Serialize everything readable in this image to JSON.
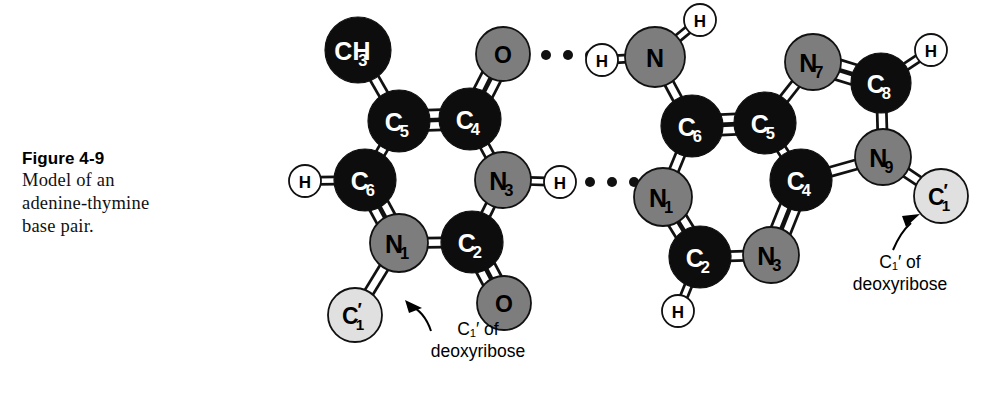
{
  "figure": {
    "number": "Figure 4-9",
    "caption_line1": "Model of an",
    "caption_line2": "adenine-thymine",
    "caption_line3": "base pair."
  },
  "colors": {
    "carbon": "#0d0d0d",
    "nitrogen": "#7d7d7d",
    "oxygen": "#7d7d7d",
    "hydrogen": "#ffffff",
    "sugar_carbon": "#e0e0e0",
    "outline": "#111111",
    "bond_fill": "#ffffff",
    "background": "#ffffff"
  },
  "annotations": {
    "left": {
      "line1": "C₁′ of",
      "line2": "deoxyribose"
    },
    "right": {
      "line1": "C₁′ of",
      "line2": "deoxyribose"
    }
  },
  "thymine": {
    "name": "thymine",
    "atoms": [
      {
        "id": "t-ch3",
        "label": "CH",
        "sub": "3",
        "type": "carbon",
        "x": 358,
        "y": 50,
        "r": 33
      },
      {
        "id": "t-c5",
        "label": "C",
        "sub": "5",
        "type": "carbon",
        "x": 399,
        "y": 121,
        "r": 31
      },
      {
        "id": "t-c4",
        "label": "C",
        "sub": "4",
        "type": "carbon",
        "x": 470,
        "y": 119,
        "r": 31
      },
      {
        "id": "t-o4",
        "label": "O",
        "sub": "",
        "type": "oxygen",
        "x": 503,
        "y": 54,
        "r": 27
      },
      {
        "id": "t-c6",
        "label": "C",
        "sub": "6",
        "type": "carbon",
        "x": 365,
        "y": 180,
        "r": 31
      },
      {
        "id": "t-h6",
        "label": "H",
        "sub": "",
        "type": "hydrogen",
        "x": 305,
        "y": 181,
        "r": 16
      },
      {
        "id": "t-n3",
        "label": "N",
        "sub": "3",
        "type": "nitrogen",
        "x": 503,
        "y": 180,
        "r": 28
      },
      {
        "id": "t-h3",
        "label": "H",
        "sub": "",
        "type": "hydrogen",
        "x": 560,
        "y": 182,
        "r": 16
      },
      {
        "id": "t-n1",
        "label": "N",
        "sub": "1",
        "type": "nitrogen",
        "x": 399,
        "y": 243,
        "r": 29
      },
      {
        "id": "t-c2",
        "label": "C",
        "sub": "2",
        "type": "carbon",
        "x": 472,
        "y": 242,
        "r": 31
      },
      {
        "id": "t-o2",
        "label": "O",
        "sub": "",
        "type": "oxygen",
        "x": 504,
        "y": 303,
        "r": 27
      },
      {
        "id": "t-c1p",
        "label": "C",
        "sub": "1",
        "prime": true,
        "type": "sugar_carbon",
        "x": 355,
        "y": 315,
        "r": 27
      }
    ],
    "bonds": [
      {
        "from": "t-ch3",
        "to": "t-c5",
        "order": 1
      },
      {
        "from": "t-c5",
        "to": "t-c4",
        "order": 2
      },
      {
        "from": "t-c4",
        "to": "t-o4",
        "order": 2
      },
      {
        "from": "t-c5",
        "to": "t-c6",
        "order": 1
      },
      {
        "from": "t-c6",
        "to": "t-h6",
        "order": 1
      },
      {
        "from": "t-c4",
        "to": "t-n3",
        "order": 1
      },
      {
        "from": "t-n3",
        "to": "t-h3",
        "order": 1
      },
      {
        "from": "t-c6",
        "to": "t-n1",
        "order": 2
      },
      {
        "from": "t-n3",
        "to": "t-c2",
        "order": 1
      },
      {
        "from": "t-n1",
        "to": "t-c2",
        "order": 1
      },
      {
        "from": "t-c2",
        "to": "t-o2",
        "order": 2
      },
      {
        "from": "t-n1",
        "to": "t-c1p",
        "order": 1
      }
    ]
  },
  "adenine": {
    "name": "adenine",
    "atoms": [
      {
        "id": "a-n6",
        "label": "N",
        "sub": "",
        "type": "nitrogen",
        "x": 655,
        "y": 57,
        "r": 30
      },
      {
        "id": "a-h6a",
        "label": "H",
        "sub": "",
        "type": "hydrogen",
        "x": 700,
        "y": 20,
        "r": 16
      },
      {
        "id": "a-h6b",
        "label": "H",
        "sub": "",
        "type": "hydrogen",
        "x": 602,
        "y": 60,
        "r": 16
      },
      {
        "id": "a-c6",
        "label": "C",
        "sub": "6",
        "type": "carbon",
        "x": 692,
        "y": 126,
        "r": 31
      },
      {
        "id": "a-c5",
        "label": "C",
        "sub": "5",
        "type": "carbon",
        "x": 765,
        "y": 123,
        "r": 31
      },
      {
        "id": "a-n7",
        "label": "N",
        "sub": "7",
        "type": "nitrogen",
        "x": 813,
        "y": 62,
        "r": 28
      },
      {
        "id": "a-c8",
        "label": "C",
        "sub": "8",
        "type": "carbon",
        "x": 881,
        "y": 83,
        "r": 30
      },
      {
        "id": "a-h8",
        "label": "H",
        "sub": "",
        "type": "hydrogen",
        "x": 931,
        "y": 50,
        "r": 16
      },
      {
        "id": "a-n9",
        "label": "N",
        "sub": "9",
        "type": "nitrogen",
        "x": 883,
        "y": 157,
        "r": 28
      },
      {
        "id": "a-c4",
        "label": "C",
        "sub": "4",
        "type": "carbon",
        "x": 801,
        "y": 180,
        "r": 31
      },
      {
        "id": "a-n1",
        "label": "N",
        "sub": "1",
        "type": "nitrogen",
        "x": 663,
        "y": 197,
        "r": 29
      },
      {
        "id": "a-c2",
        "label": "C",
        "sub": "2",
        "type": "carbon",
        "x": 700,
        "y": 257,
        "r": 31
      },
      {
        "id": "a-h2",
        "label": "H",
        "sub": "",
        "type": "hydrogen",
        "x": 678,
        "y": 311,
        "r": 16
      },
      {
        "id": "a-n3",
        "label": "N",
        "sub": "3",
        "type": "nitrogen",
        "x": 771,
        "y": 255,
        "r": 28
      },
      {
        "id": "a-c1p",
        "label": "C",
        "sub": "1",
        "prime": true,
        "type": "sugar_carbon",
        "x": 941,
        "y": 196,
        "r": 27
      }
    ],
    "bonds": [
      {
        "from": "a-n6",
        "to": "a-h6a",
        "order": 1
      },
      {
        "from": "a-n6",
        "to": "a-h6b",
        "order": 1
      },
      {
        "from": "a-n6",
        "to": "a-c6",
        "order": 1
      },
      {
        "from": "a-c6",
        "to": "a-c5",
        "order": 2
      },
      {
        "from": "a-c5",
        "to": "a-n7",
        "order": 1
      },
      {
        "from": "a-n7",
        "to": "a-c8",
        "order": 2
      },
      {
        "from": "a-c8",
        "to": "a-h8",
        "order": 1
      },
      {
        "from": "a-c8",
        "to": "a-n9",
        "order": 1
      },
      {
        "from": "a-n9",
        "to": "a-c4",
        "order": 1
      },
      {
        "from": "a-c5",
        "to": "a-c4",
        "order": 1
      },
      {
        "from": "a-c6",
        "to": "a-n1",
        "order": 1
      },
      {
        "from": "a-n1",
        "to": "a-c2",
        "order": 2
      },
      {
        "from": "a-c2",
        "to": "a-h2",
        "order": 1
      },
      {
        "from": "a-c2",
        "to": "a-n3",
        "order": 1
      },
      {
        "from": "a-n3",
        "to": "a-c4",
        "order": 2
      },
      {
        "from": "a-n9",
        "to": "a-c1p",
        "order": 1
      }
    ]
  },
  "hydrogen_bonds": [
    {
      "id": "hbond-upper",
      "dots": [
        [
          546,
          55
        ],
        [
          568,
          55
        ],
        [
          590,
          55
        ]
      ],
      "radius": 5
    },
    {
      "id": "hbond-lower",
      "dots": [
        [
          590,
          182
        ],
        [
          612,
          182
        ],
        [
          634,
          182
        ]
      ],
      "radius": 5
    }
  ]
}
